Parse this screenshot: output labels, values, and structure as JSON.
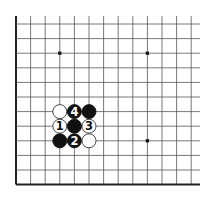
{
  "diagram": {
    "type": "go-board-fragment",
    "grid": {
      "columns": 13,
      "rows": 12,
      "visible_edges": [
        "left",
        "bottom"
      ],
      "line_color": "#555555",
      "edge_color": "#222222"
    },
    "star_points": [
      {
        "col": 3,
        "row": 2
      },
      {
        "col": 9,
        "row": 2
      },
      {
        "col": 9,
        "row": 8
      }
    ],
    "stones": [
      {
        "col": 3,
        "row": 6,
        "color": "white",
        "label": ""
      },
      {
        "col": 4,
        "row": 6,
        "color": "black",
        "label": "4"
      },
      {
        "col": 5,
        "row": 6,
        "color": "black",
        "label": ""
      },
      {
        "col": 3,
        "row": 7,
        "color": "white",
        "label": "1"
      },
      {
        "col": 4,
        "row": 7,
        "color": "black",
        "label": ""
      },
      {
        "col": 5,
        "row": 7,
        "color": "white",
        "label": "3"
      },
      {
        "col": 3,
        "row": 8,
        "color": "black",
        "label": ""
      },
      {
        "col": 4,
        "row": 8,
        "color": "black",
        "label": "2"
      },
      {
        "col": 5,
        "row": 8,
        "color": "white",
        "label": ""
      }
    ],
    "colors": {
      "black_stone": "#111111",
      "white_stone": "#ffffff",
      "white_stone_outline": "#333333",
      "black_label": "#ffffff",
      "white_label": "#111111"
    }
  }
}
